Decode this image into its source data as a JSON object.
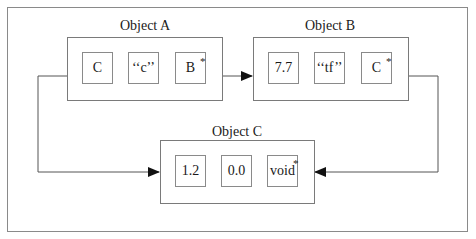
{
  "diagram": {
    "objects": [
      {
        "id": "A",
        "label": "Object A",
        "fields": [
          {
            "value": "C",
            "pointer": false
          },
          {
            "value": "‘‘c’’",
            "pointer": false
          },
          {
            "value": "B",
            "pointer": true
          }
        ]
      },
      {
        "id": "B",
        "label": "Object B",
        "fields": [
          {
            "value": "7.7",
            "pointer": false
          },
          {
            "value": "‘‘tf’’",
            "pointer": false
          },
          {
            "value": "C",
            "pointer": true
          }
        ]
      },
      {
        "id": "C",
        "label": "Object C",
        "fields": [
          {
            "value": "1.2",
            "pointer": false
          },
          {
            "value": "0.0",
            "pointer": false
          },
          {
            "value": "void",
            "pointer": true
          }
        ]
      }
    ],
    "pointer_marker": "*",
    "edges": [
      {
        "from": "Object A.C",
        "to": "Object C"
      },
      {
        "from": "Object A.B*",
        "to": "Object B"
      },
      {
        "from": "Object B.C*",
        "to": "Object C"
      }
    ],
    "colors": {
      "line": "#555555",
      "box_border": "#7a7a7a",
      "text": "#1a1a1a",
      "background": "#ffffff"
    }
  }
}
